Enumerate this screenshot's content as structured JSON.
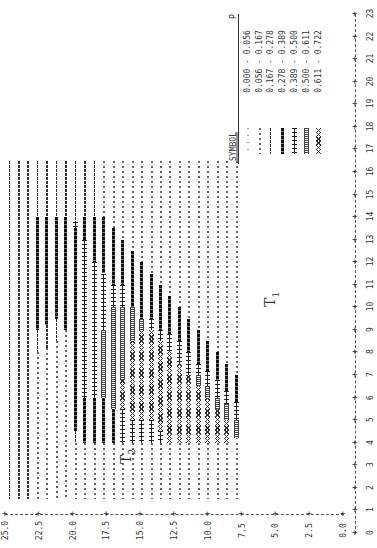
{
  "chart_data": {
    "type": "heatmap",
    "title": "",
    "orientation_note_visible": "rotated 90 degrees counter-clockwise",
    "xlabel": "T1",
    "ylabel": "T2",
    "x_axis": {
      "label": "T1",
      "ticks": [
        "0",
        "1",
        "2",
        "3",
        "4",
        "5",
        "6",
        "7",
        "8",
        "9",
        "10",
        "11",
        "12",
        "13",
        "14",
        "15",
        "16",
        "17",
        "18",
        "19",
        "20",
        "21",
        "22",
        "23"
      ],
      "range": [
        0,
        23
      ]
    },
    "y_axis": {
      "label": "T2",
      "ticks": [
        "0.0",
        "2.5",
        "5.0",
        "7.5",
        "10.0",
        "12.5",
        "15.0",
        "17.5",
        "20.0",
        "22.5",
        "25.0"
      ],
      "range": [
        0.0,
        25.0
      ]
    },
    "legend": {
      "header_symbol": "SYMBOL",
      "header_value": "P",
      "entries": [
        {
          "symbol": "......",
          "range": "0.000 - 0.056",
          "low": 0.0,
          "high": 0.056
        },
        {
          "symbol": "''''''",
          "range": "0.056 - 0.167",
          "low": 0.056,
          "high": 0.167
        },
        {
          "symbol": "------",
          "range": "0.167 - 0.278",
          "low": 0.167,
          "high": 0.278
        },
        {
          "symbol": "======",
          "range": "0.278 - 0.389",
          "low": 0.278,
          "high": 0.389
        },
        {
          "symbol": "++++++",
          "range": "0.389 - 0.500",
          "low": 0.389,
          "high": 0.5
        },
        {
          "symbol": "OOOOOO",
          "range": "0.500 - 0.611",
          "low": 0.5,
          "high": 0.611
        },
        {
          "symbol": "XXXXXX",
          "range": "0.611 - 0.722",
          "low": 0.611,
          "high": 0.722
        }
      ]
    },
    "annotations": [
      {
        "text": "T",
        "sub": "1",
        "near": "T1 ~ 11, T2 ~ 3.5"
      },
      {
        "text": "T",
        "sub": "2",
        "near": "T1 ~ 3, T2 ~ 19"
      }
    ],
    "plot_extent": {
      "t1_min": 1.5,
      "t1_max": 16.5,
      "t2_min": 7.3,
      "t2_max": 25.0
    },
    "columns": [
      {
        "t2": 24.7,
        "segments": [
          [
            2,
            1.5,
            16.5
          ]
        ]
      },
      {
        "t2": 24.0,
        "segments": [
          [
            2,
            1.5,
            16.5
          ]
        ]
      },
      {
        "t2": 23.3,
        "segments": [
          [
            2,
            1.5,
            16.5
          ]
        ]
      },
      {
        "t2": 22.6,
        "segments": [
          [
            1,
            1.5,
            8.0
          ],
          [
            2,
            8.0,
            9.0
          ],
          [
            3,
            9.0,
            14.0
          ],
          [
            2,
            14.0,
            16.5
          ]
        ]
      },
      {
        "t2": 21.9,
        "segments": [
          [
            1,
            1.5,
            8.2
          ],
          [
            2,
            8.2,
            9.2
          ],
          [
            3,
            9.2,
            14.0
          ],
          [
            2,
            14.0,
            16.5
          ]
        ]
      },
      {
        "t2": 21.2,
        "segments": [
          [
            1,
            1.5,
            8.5
          ],
          [
            2,
            8.5,
            9.5
          ],
          [
            3,
            9.5,
            14.0
          ],
          [
            2,
            14.0,
            16.5
          ]
        ]
      },
      {
        "t2": 20.5,
        "segments": [
          [
            1,
            1.5,
            9.0
          ],
          [
            3,
            9.0,
            14.0
          ],
          [
            2,
            14.0,
            16.5
          ]
        ]
      },
      {
        "t2": 19.8,
        "segments": [
          [
            1,
            1.5,
            4.0
          ],
          [
            2,
            4.0,
            4.5
          ],
          [
            3,
            4.5,
            13.5
          ],
          [
            4,
            13.5,
            13.8
          ],
          [
            2,
            13.8,
            16.5
          ]
        ]
      },
      {
        "t2": 19.1,
        "segments": [
          [
            1,
            1.5,
            4.0
          ],
          [
            3,
            4.0,
            6.0
          ],
          [
            4,
            6.0,
            13.0
          ],
          [
            3,
            13.0,
            14.0
          ],
          [
            2,
            14.0,
            16.5
          ]
        ]
      },
      {
        "t2": 18.4,
        "segments": [
          [
            1,
            1.5,
            4.0
          ],
          [
            3,
            4.0,
            6.0
          ],
          [
            4,
            6.0,
            12.0
          ],
          [
            3,
            12.0,
            14.0
          ],
          [
            2,
            14.0,
            16.5
          ]
        ]
      },
      {
        "t2": 17.7,
        "segments": [
          [
            1,
            1.5,
            4.0
          ],
          [
            3,
            4.0,
            6.0
          ],
          [
            5,
            6.0,
            9.0
          ],
          [
            4,
            9.0,
            11.5
          ],
          [
            3,
            11.5,
            14.0
          ],
          [
            1,
            14.0,
            16.5
          ]
        ]
      },
      {
        "t2": 17.0,
        "segments": [
          [
            1,
            1.5,
            4.0
          ],
          [
            3,
            4.0,
            5.5
          ],
          [
            5,
            5.5,
            10.0
          ],
          [
            4,
            10.0,
            11.0
          ],
          [
            3,
            11.0,
            13.5
          ],
          [
            1,
            13.5,
            16.5
          ]
        ]
      },
      {
        "t2": 16.3,
        "segments": [
          [
            1,
            1.5,
            4.0
          ],
          [
            4,
            4.0,
            5.5
          ],
          [
            6,
            5.5,
            6.8
          ],
          [
            5,
            6.8,
            10.0
          ],
          [
            4,
            10.0,
            11.0
          ],
          [
            3,
            11.0,
            13.0
          ],
          [
            1,
            13.0,
            16.5
          ]
        ]
      },
      {
        "t2": 15.6,
        "segments": [
          [
            1,
            1.5,
            4.0
          ],
          [
            4,
            4.0,
            5.0
          ],
          [
            6,
            5.0,
            8.5
          ],
          [
            5,
            8.5,
            10.0
          ],
          [
            3,
            10.0,
            12.5
          ],
          [
            1,
            12.5,
            16.5
          ]
        ]
      },
      {
        "t2": 14.9,
        "segments": [
          [
            1,
            1.5,
            4.0
          ],
          [
            4,
            4.0,
            5.0
          ],
          [
            6,
            5.0,
            9.0
          ],
          [
            5,
            9.0,
            9.5
          ],
          [
            3,
            9.5,
            12.0
          ],
          [
            1,
            12.0,
            16.5
          ]
        ]
      },
      {
        "t2": 14.2,
        "segments": [
          [
            1,
            1.5,
            4.0
          ],
          [
            4,
            4.0,
            5.0
          ],
          [
            6,
            5.0,
            9.0
          ],
          [
            4,
            9.0,
            9.5
          ],
          [
            3,
            9.5,
            11.5
          ],
          [
            1,
            11.5,
            16.5
          ]
        ]
      },
      {
        "t2": 13.5,
        "segments": [
          [
            1,
            1.5,
            4.0
          ],
          [
            4,
            4.0,
            4.5
          ],
          [
            6,
            4.5,
            8.5
          ],
          [
            4,
            8.5,
            9.0
          ],
          [
            3,
            9.0,
            11.0
          ],
          [
            1,
            11.0,
            16.5
          ]
        ]
      },
      {
        "t2": 12.8,
        "segments": [
          [
            1,
            1.5,
            4.0
          ],
          [
            6,
            4.0,
            8.0
          ],
          [
            4,
            8.0,
            8.8
          ],
          [
            3,
            8.8,
            10.5
          ],
          [
            1,
            10.5,
            16.5
          ]
        ]
      },
      {
        "t2": 12.1,
        "segments": [
          [
            1,
            1.5,
            4.0
          ],
          [
            6,
            4.0,
            7.5
          ],
          [
            4,
            7.5,
            8.5
          ],
          [
            3,
            8.5,
            10.0
          ],
          [
            1,
            10.0,
            16.5
          ]
        ]
      },
      {
        "t2": 11.4,
        "segments": [
          [
            1,
            1.5,
            4.0
          ],
          [
            6,
            4.0,
            7.0
          ],
          [
            4,
            7.0,
            8.0
          ],
          [
            3,
            8.0,
            9.5
          ],
          [
            1,
            9.5,
            16.5
          ]
        ]
      },
      {
        "t2": 10.7,
        "segments": [
          [
            1,
            1.5,
            4.0
          ],
          [
            6,
            4.0,
            6.5
          ],
          [
            5,
            6.5,
            7.0
          ],
          [
            4,
            7.0,
            7.5
          ],
          [
            3,
            7.5,
            9.0
          ],
          [
            1,
            9.0,
            16.5
          ]
        ]
      },
      {
        "t2": 10.0,
        "segments": [
          [
            1,
            1.5,
            4.0
          ],
          [
            6,
            4.0,
            6.0
          ],
          [
            5,
            6.0,
            6.5
          ],
          [
            4,
            6.5,
            7.2
          ],
          [
            3,
            7.2,
            8.5
          ],
          [
            1,
            8.5,
            16.5
          ]
        ]
      },
      {
        "t2": 9.3,
        "segments": [
          [
            1,
            1.5,
            4.0
          ],
          [
            6,
            4.0,
            5.5
          ],
          [
            5,
            5.5,
            6.0
          ],
          [
            4,
            6.0,
            6.8
          ],
          [
            3,
            6.8,
            8.0
          ],
          [
            1,
            8.0,
            16.5
          ]
        ]
      },
      {
        "t2": 8.6,
        "segments": [
          [
            1,
            1.5,
            4.0
          ],
          [
            6,
            4.0,
            5.0
          ],
          [
            5,
            5.0,
            5.7
          ],
          [
            4,
            5.7,
            6.3
          ],
          [
            3,
            6.3,
            7.5
          ],
          [
            1,
            7.5,
            16.5
          ]
        ]
      },
      {
        "t2": 7.9,
        "segments": [
          [
            1,
            1.5,
            4.0
          ],
          [
            0,
            4.0,
            4.2
          ],
          [
            5,
            4.2,
            5.0
          ],
          [
            4,
            5.0,
            5.8
          ],
          [
            3,
            5.8,
            7.0
          ],
          [
            1,
            7.0,
            16.5
          ]
        ]
      }
    ]
  }
}
